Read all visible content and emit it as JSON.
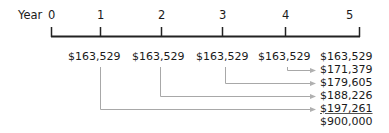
{
  "timeline": {
    "axis_label": "Year",
    "years": [
      "0",
      "1",
      "2",
      "3",
      "4",
      "5"
    ],
    "axis_color": "#222222",
    "connector_color": "#a8a8a8"
  },
  "cash_flows": [
    {
      "year": "1",
      "amount": "$163,529"
    },
    {
      "year": "2",
      "amount": "$163,529"
    },
    {
      "year": "3",
      "amount": "$163,529"
    },
    {
      "year": "4",
      "amount": "$163,529"
    },
    {
      "year": "5",
      "amount": "$163,529"
    }
  ],
  "future_values": [
    {
      "label": "$163,529",
      "from_year": "5"
    },
    {
      "label": "$171,379",
      "from_year": "4"
    },
    {
      "label": "$179,605",
      "from_year": "3"
    },
    {
      "label": "$188,226",
      "from_year": "2"
    },
    {
      "label": "$197,261",
      "from_year": "1",
      "underlined": true
    },
    {
      "label": "$900,000",
      "is_total": true
    }
  ]
}
